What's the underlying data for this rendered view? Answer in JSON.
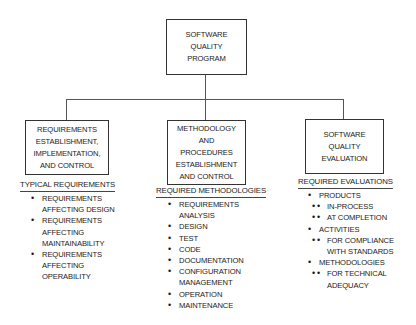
{
  "root": {
    "lines": [
      "SOFTWARE",
      "QUALITY",
      "PROGRAM"
    ]
  },
  "branches": [
    {
      "box_lines": [
        "REQUIREMENTS",
        "ESTABLISHMENT,",
        "IMPLEMENTATION,",
        "AND CONTROL"
      ],
      "header": "TYPICAL REQUIREMENTS",
      "items": [
        {
          "level": 1,
          "lines": [
            "REQUIREMENTS",
            "AFFECTING DESIGN"
          ]
        },
        {
          "level": 1,
          "lines": [
            "REQUIREMENTS",
            "AFFECTING",
            "MAINTAINABILITY"
          ]
        },
        {
          "level": 1,
          "lines": [
            "REQUIREMENTS",
            "AFFECTING",
            "OPERABILITY"
          ]
        }
      ]
    },
    {
      "box_lines": [
        "METHODOLOGY",
        "AND",
        "PROCEDURES",
        "ESTABLISHMENT",
        "AND CONTROL"
      ],
      "header": "REQUIRED METHODOLOGIES",
      "items": [
        {
          "level": 1,
          "lines": [
            "REQUIREMENTS",
            "ANALYSIS"
          ]
        },
        {
          "level": 1,
          "lines": [
            "DESIGN"
          ]
        },
        {
          "level": 1,
          "lines": [
            "TEST"
          ]
        },
        {
          "level": 1,
          "lines": [
            "CODE"
          ]
        },
        {
          "level": 1,
          "lines": [
            "DOCUMENTATION"
          ]
        },
        {
          "level": 1,
          "lines": [
            "CONFIGURATION",
            "MANAGEMENT"
          ]
        },
        {
          "level": 1,
          "lines": [
            "OPERATION"
          ]
        },
        {
          "level": 1,
          "lines": [
            "MAINTENANCE"
          ]
        }
      ]
    },
    {
      "box_lines": [
        "SOFTWARE",
        "QUALITY",
        "EVALUATION"
      ],
      "header": "REQUIRED EVALUATIONS",
      "items": [
        {
          "level": 1,
          "lines": [
            "PRODUCTS"
          ]
        },
        {
          "level": 2,
          "lines": [
            "IN-PROCESS"
          ]
        },
        {
          "level": 2,
          "lines": [
            "AT COMPLETION"
          ]
        },
        {
          "level": 1,
          "lines": [
            "ACTIVITIES"
          ]
        },
        {
          "level": 2,
          "lines": [
            "FOR COMPLIANCE",
            "WITH STANDARDS"
          ]
        },
        {
          "level": 1,
          "lines": [
            "METHODOLOGIES"
          ]
        },
        {
          "level": 2,
          "lines": [
            "FOR TECHNICAL",
            "ADEQUACY"
          ]
        }
      ]
    }
  ]
}
